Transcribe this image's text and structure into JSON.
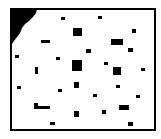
{
  "map": {
    "width": 161,
    "height": 139,
    "background": "#ffffff",
    "obstacle_color": "#000000",
    "frame": {
      "x": 10,
      "y": 8,
      "width": 146,
      "height": 123,
      "stroke_width": 2
    },
    "corner_blob": {
      "points": "11,9 37,9 36,13 33,17 29,21 25,24 22,28 20,33 17,37 14,41 11,45"
    },
    "obstacles": [
      {
        "x": 61,
        "y": 17,
        "w": 4,
        "h": 3
      },
      {
        "x": 98,
        "y": 16,
        "w": 4,
        "h": 3
      },
      {
        "x": 73,
        "y": 28,
        "w": 9,
        "h": 8
      },
      {
        "x": 132,
        "y": 29,
        "w": 4,
        "h": 4
      },
      {
        "x": 41,
        "y": 40,
        "w": 9,
        "h": 3
      },
      {
        "x": 111,
        "y": 39,
        "w": 12,
        "h": 6
      },
      {
        "x": 86,
        "y": 49,
        "w": 5,
        "h": 4
      },
      {
        "x": 128,
        "y": 48,
        "w": 5,
        "h": 4
      },
      {
        "x": 15,
        "y": 55,
        "w": 4,
        "h": 3
      },
      {
        "x": 56,
        "y": 57,
        "w": 4,
        "h": 3
      },
      {
        "x": 72,
        "y": 60,
        "w": 10,
        "h": 11
      },
      {
        "x": 104,
        "y": 62,
        "w": 4,
        "h": 3
      },
      {
        "x": 35,
        "y": 67,
        "w": 3,
        "h": 7
      },
      {
        "x": 113,
        "y": 67,
        "w": 8,
        "h": 8
      },
      {
        "x": 141,
        "y": 68,
        "w": 4,
        "h": 3
      },
      {
        "x": 17,
        "y": 86,
        "w": 4,
        "h": 3
      },
      {
        "x": 74,
        "y": 82,
        "w": 5,
        "h": 6
      },
      {
        "x": 116,
        "y": 85,
        "w": 4,
        "h": 3
      },
      {
        "x": 58,
        "y": 89,
        "w": 4,
        "h": 3
      },
      {
        "x": 93,
        "y": 94,
        "w": 4,
        "h": 3
      },
      {
        "x": 136,
        "y": 95,
        "w": 4,
        "h": 3
      },
      {
        "x": 34,
        "y": 103,
        "w": 4,
        "h": 6
      },
      {
        "x": 34,
        "y": 106,
        "w": 16,
        "h": 3
      },
      {
        "x": 119,
        "y": 105,
        "w": 10,
        "h": 5
      },
      {
        "x": 74,
        "y": 111,
        "w": 5,
        "h": 6
      },
      {
        "x": 102,
        "y": 110,
        "w": 4,
        "h": 4
      },
      {
        "x": 50,
        "y": 122,
        "w": 5,
        "h": 3
      },
      {
        "x": 128,
        "y": 122,
        "w": 5,
        "h": 4
      }
    ]
  }
}
